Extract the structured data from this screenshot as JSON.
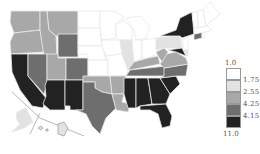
{
  "map": {
    "type": "choropleth",
    "region": "United States",
    "colors": {
      "c1": "#ffffff",
      "c2": "#e2e2e2",
      "c3": "#a8a8a8",
      "c4": "#6e6e6e",
      "c5": "#222222",
      "border": "#e8e8e8"
    }
  },
  "legend": {
    "top_label": "1.0",
    "bottom_label": "11.0",
    "bins": [
      {
        "label": "",
        "color": "#ffffff"
      },
      {
        "label": "1.75",
        "color": "#e2e2e2"
      },
      {
        "label": "2.55",
        "color": "#a8a8a8"
      },
      {
        "label": "4.25",
        "color": "#6e6e6e"
      },
      {
        "label": "4.15",
        "color": "#222222"
      }
    ]
  }
}
